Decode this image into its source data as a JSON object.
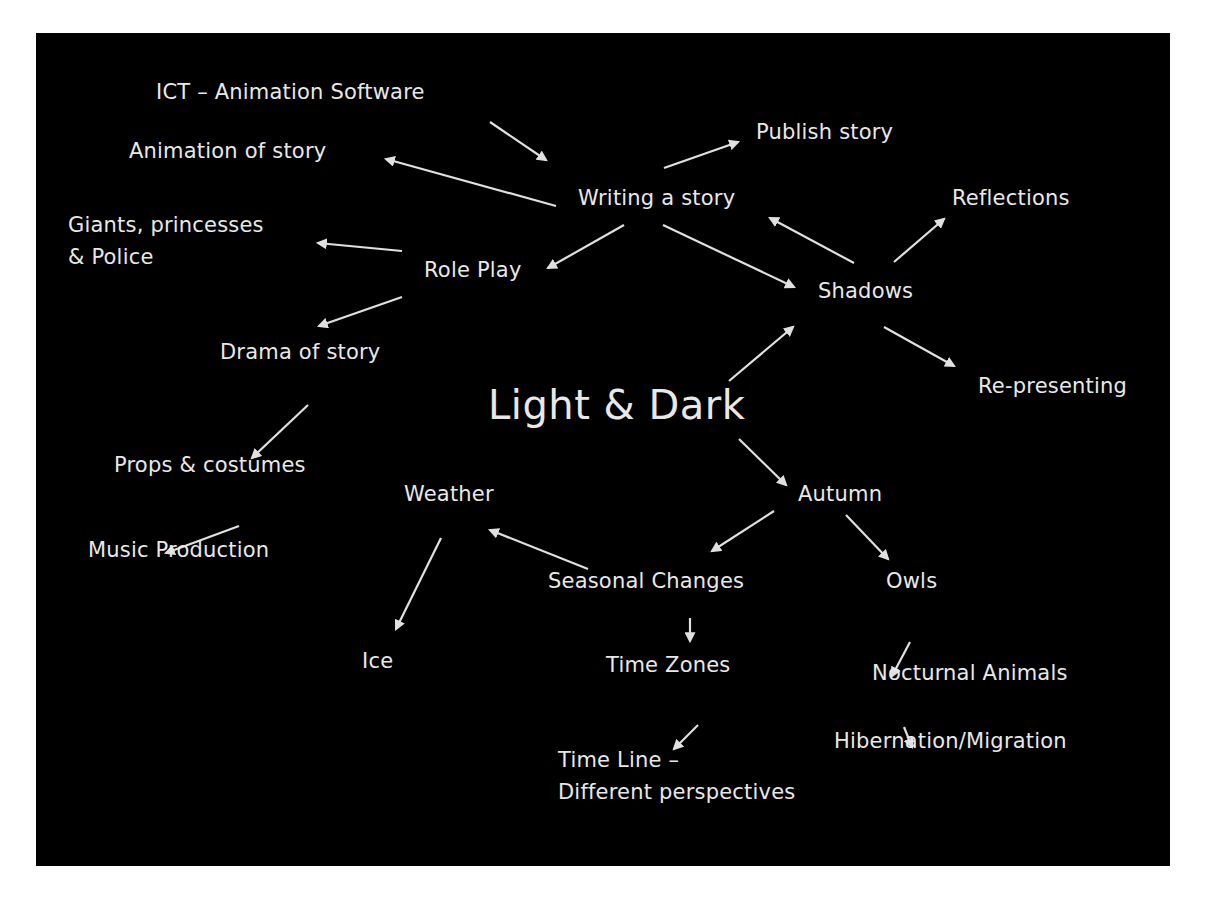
{
  "diagram": {
    "background_color": "#000000",
    "text_color": "#e8e8e8",
    "arrow_color": "#e0e0e0",
    "center": "Light & Dark",
    "nodes": {
      "ict": "ICT – Animation Software",
      "animation": "Animation of story",
      "publish": "Publish story",
      "writing": "Writing a story",
      "reflections": "Reflections",
      "giants": "Giants, princesses\n& Police",
      "roleplay": "Role Play",
      "shadows": "Shadows",
      "drama": "Drama of story",
      "representing": "Re-presenting",
      "props": "Props & costumes",
      "weather": "Weather",
      "autumn": "Autumn",
      "music": "Music Production",
      "seasonal": "Seasonal Changes",
      "owls": "Owls",
      "ice": "Ice",
      "timezones": "Time Zones",
      "nocturnal": "Nocturnal Animals",
      "timeline": "Time Line –\nDifferent perspectives",
      "hibernation": "Hibernation/Migration"
    },
    "edges": [
      {
        "from": "ICT – Animation Software",
        "to": "Writing a story"
      },
      {
        "from": "Writing a story",
        "to": "Publish story"
      },
      {
        "from": "Writing a story",
        "to": "Animation of story"
      },
      {
        "from": "Writing a story",
        "to": "Role Play"
      },
      {
        "from": "Writing a story",
        "to": "Shadows"
      },
      {
        "from": "Shadows",
        "to": "Writing a story"
      },
      {
        "from": "Shadows",
        "to": "Reflections"
      },
      {
        "from": "Shadows",
        "to": "Re-presenting"
      },
      {
        "from": "Light & Dark",
        "to": "Shadows"
      },
      {
        "from": "Light & Dark",
        "to": "Autumn"
      },
      {
        "from": "Role Play",
        "to": "Giants, princesses & Police"
      },
      {
        "from": "Role Play",
        "to": "Drama of story"
      },
      {
        "from": "Drama of story",
        "to": "Props & costumes"
      },
      {
        "from": "Props & costumes",
        "to": "Music Production"
      },
      {
        "from": "Autumn",
        "to": "Seasonal Changes"
      },
      {
        "from": "Autumn",
        "to": "Owls"
      },
      {
        "from": "Seasonal Changes",
        "to": "Weather"
      },
      {
        "from": "Weather",
        "to": "Ice"
      },
      {
        "from": "Seasonal Changes",
        "to": "Time Zones"
      },
      {
        "from": "Time Zones",
        "to": "Time Line – Different perspectives"
      },
      {
        "from": "Owls",
        "to": "Nocturnal Animals"
      },
      {
        "from": "Nocturnal Animals",
        "to": "Hibernation/Migration"
      }
    ]
  }
}
